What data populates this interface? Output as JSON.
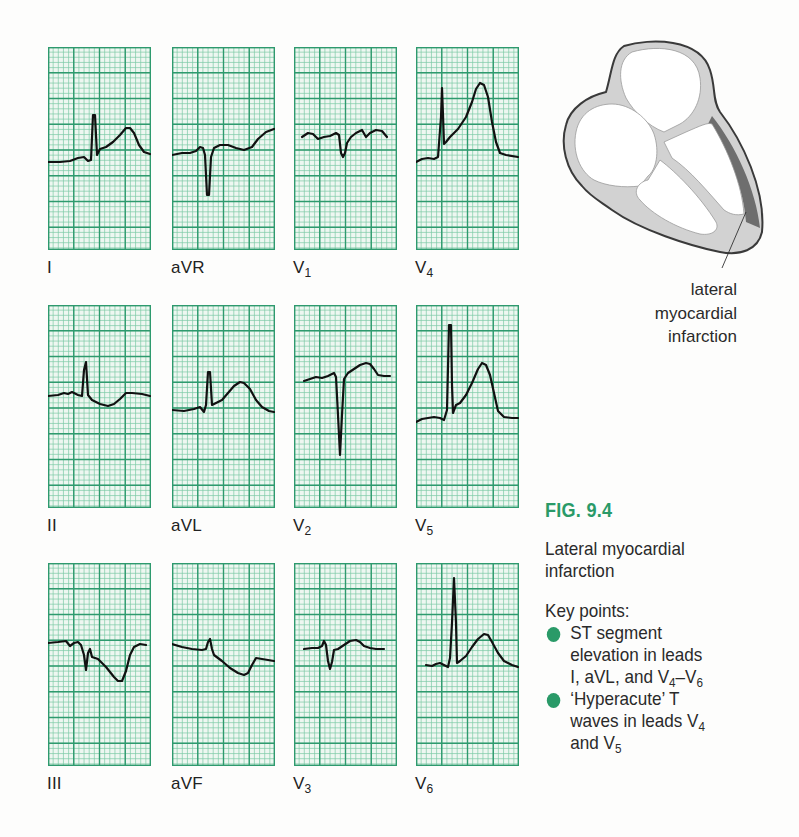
{
  "figure": {
    "number": "FIG. 9.4",
    "title_lines": [
      "Lateral myocardial",
      "infarction"
    ],
    "key_points_heading": "Key points:",
    "key_points": [
      {
        "lines": [
          "ST segment",
          "elevation in leads"
        ],
        "last_line": {
          "text": "I, aVL, and V",
          "sub": "4",
          "text2": "–V",
          "sub2": "6"
        }
      },
      {
        "lines": [
          "‘Hyperacute’ T"
        ],
        "line2": {
          "text": "waves in leads V",
          "sub": "4"
        },
        "line3": {
          "text": "and V",
          "sub": "5"
        }
      }
    ],
    "accent_color": "#2a9a68"
  },
  "diagram": {
    "label_lines": [
      "lateral",
      "myocardial",
      "infarction"
    ],
    "colors": {
      "wall": "#d2d2d2",
      "infarct": "#6e6e6e",
      "outline": "#3a3a3a",
      "chamber": "#ffffff"
    }
  },
  "ecg_grid": {
    "major_color": "#2e9a6e",
    "minor_color": "#7ccaa6",
    "background": "#eef7f1",
    "trace_color": "#111111"
  },
  "chart_data": {
    "type": "line",
    "xlabel": "",
    "ylabel": "",
    "grid": true,
    "panel_size": [
      103,
      203
    ],
    "leads": [
      {
        "name": "I",
        "sub": "",
        "col": 0,
        "row": 0,
        "points": [
          [
            0,
            115
          ],
          [
            12,
            115
          ],
          [
            22,
            114
          ],
          [
            30,
            111
          ],
          [
            36,
            110
          ],
          [
            40,
            114
          ],
          [
            43,
            113
          ],
          [
            45,
            68
          ],
          [
            47,
            68
          ],
          [
            49,
            108
          ],
          [
            52,
            102
          ],
          [
            58,
            100
          ],
          [
            65,
            95
          ],
          [
            72,
            88
          ],
          [
            78,
            81
          ],
          [
            82,
            81
          ],
          [
            86,
            86
          ],
          [
            91,
            98
          ],
          [
            96,
            105
          ],
          [
            102,
            107
          ]
        ]
      },
      {
        "name": "aVR",
        "sub": "",
        "col": 1,
        "row": 0,
        "points": [
          [
            0,
            108
          ],
          [
            10,
            106
          ],
          [
            18,
            106
          ],
          [
            24,
            104
          ],
          [
            28,
            100
          ],
          [
            31,
            101
          ],
          [
            33,
            108
          ],
          [
            35,
            148
          ],
          [
            37,
            148
          ],
          [
            39,
            110
          ],
          [
            42,
            101
          ],
          [
            48,
            98
          ],
          [
            56,
            98
          ],
          [
            64,
            101
          ],
          [
            72,
            103
          ],
          [
            80,
            100
          ],
          [
            86,
            92
          ],
          [
            94,
            85
          ],
          [
            102,
            82
          ]
        ]
      },
      {
        "name": "V",
        "sub": "1",
        "col": 2,
        "row": 0,
        "points": [
          [
            8,
            90
          ],
          [
            14,
            86
          ],
          [
            19,
            87
          ],
          [
            24,
            92
          ],
          [
            30,
            90
          ],
          [
            36,
            89
          ],
          [
            42,
            86
          ],
          [
            45,
            88
          ],
          [
            47,
            106
          ],
          [
            49,
            110
          ],
          [
            51,
            106
          ],
          [
            53,
            96
          ],
          [
            57,
            90
          ],
          [
            62,
            86
          ],
          [
            68,
            83
          ],
          [
            72,
            90
          ],
          [
            76,
            86
          ],
          [
            82,
            83
          ],
          [
            88,
            84
          ],
          [
            93,
            90
          ]
        ]
      },
      {
        "name": "V",
        "sub": "4",
        "col": 3,
        "row": 0,
        "points": [
          [
            0,
            115
          ],
          [
            6,
            112
          ],
          [
            12,
            111
          ],
          [
            18,
            112
          ],
          [
            22,
            110
          ],
          [
            25,
            70
          ],
          [
            26,
            41
          ],
          [
            27,
            68
          ],
          [
            28,
            97
          ],
          [
            30,
            95
          ],
          [
            34,
            90
          ],
          [
            42,
            82
          ],
          [
            50,
            70
          ],
          [
            56,
            55
          ],
          [
            60,
            42
          ],
          [
            64,
            36
          ],
          [
            68,
            38
          ],
          [
            72,
            50
          ],
          [
            76,
            75
          ],
          [
            80,
            95
          ],
          [
            84,
            106
          ],
          [
            90,
            108
          ],
          [
            102,
            110
          ]
        ]
      },
      {
        "name": "II",
        "sub": "",
        "col": 0,
        "row": 1,
        "points": [
          [
            0,
            91
          ],
          [
            10,
            90
          ],
          [
            16,
            88
          ],
          [
            20,
            89
          ],
          [
            24,
            87
          ],
          [
            30,
            90
          ],
          [
            34,
            91
          ],
          [
            36,
            65
          ],
          [
            38,
            57
          ],
          [
            40,
            90
          ],
          [
            44,
            95
          ],
          [
            52,
            99
          ],
          [
            60,
            101
          ],
          [
            66,
            99
          ],
          [
            72,
            94
          ],
          [
            78,
            88
          ],
          [
            84,
            88
          ],
          [
            94,
            89
          ],
          [
            102,
            91
          ]
        ]
      },
      {
        "name": "aVL",
        "sub": "",
        "col": 1,
        "row": 1,
        "points": [
          [
            0,
            105
          ],
          [
            12,
            106
          ],
          [
            22,
            104
          ],
          [
            28,
            102
          ],
          [
            32,
            107
          ],
          [
            34,
            100
          ],
          [
            36,
            67
          ],
          [
            38,
            67
          ],
          [
            40,
            100
          ],
          [
            44,
            98
          ],
          [
            50,
            95
          ],
          [
            56,
            88
          ],
          [
            62,
            81
          ],
          [
            68,
            77
          ],
          [
            72,
            78
          ],
          [
            78,
            84
          ],
          [
            84,
            95
          ],
          [
            90,
            102
          ],
          [
            97,
            106
          ],
          [
            102,
            107
          ]
        ]
      },
      {
        "name": "V",
        "sub": "2",
        "col": 2,
        "row": 1,
        "points": [
          [
            10,
            76
          ],
          [
            16,
            74
          ],
          [
            22,
            72
          ],
          [
            28,
            73
          ],
          [
            34,
            71
          ],
          [
            40,
            68
          ],
          [
            42,
            72
          ],
          [
            44,
            110
          ],
          [
            46,
            150
          ],
          [
            48,
            110
          ],
          [
            50,
            74
          ],
          [
            54,
            68
          ],
          [
            60,
            64
          ],
          [
            66,
            60
          ],
          [
            72,
            58
          ],
          [
            76,
            59
          ],
          [
            80,
            64
          ],
          [
            84,
            70
          ],
          [
            90,
            71
          ],
          [
            96,
            71
          ]
        ]
      },
      {
        "name": "V",
        "sub": "5",
        "col": 3,
        "row": 1,
        "points": [
          [
            0,
            117
          ],
          [
            6,
            114
          ],
          [
            12,
            113
          ],
          [
            18,
            112
          ],
          [
            24,
            113
          ],
          [
            28,
            115
          ],
          [
            31,
            105
          ],
          [
            33,
            20
          ],
          [
            35,
            20
          ],
          [
            36,
            80
          ],
          [
            37,
            108
          ],
          [
            40,
            100
          ],
          [
            44,
            98
          ],
          [
            50,
            90
          ],
          [
            56,
            78
          ],
          [
            62,
            64
          ],
          [
            66,
            58
          ],
          [
            70,
            60
          ],
          [
            74,
            70
          ],
          [
            78,
            88
          ],
          [
            82,
            106
          ],
          [
            88,
            112
          ],
          [
            96,
            113
          ],
          [
            102,
            113
          ]
        ]
      },
      {
        "name": "III",
        "sub": "",
        "col": 0,
        "row": 2,
        "points": [
          [
            0,
            80
          ],
          [
            10,
            79
          ],
          [
            18,
            78
          ],
          [
            22,
            83
          ],
          [
            26,
            80
          ],
          [
            30,
            79
          ],
          [
            33,
            82
          ],
          [
            36,
            92
          ],
          [
            38,
            107
          ],
          [
            40,
            90
          ],
          [
            42,
            86
          ],
          [
            44,
            94
          ],
          [
            50,
            96
          ],
          [
            58,
            104
          ],
          [
            66,
            114
          ],
          [
            70,
            118
          ],
          [
            74,
            118
          ],
          [
            78,
            108
          ],
          [
            82,
            92
          ],
          [
            86,
            84
          ],
          [
            92,
            81
          ],
          [
            98,
            82
          ]
        ]
      },
      {
        "name": "aVF",
        "sub": "",
        "col": 1,
        "row": 2,
        "points": [
          [
            0,
            81
          ],
          [
            10,
            84
          ],
          [
            20,
            86
          ],
          [
            30,
            87
          ],
          [
            34,
            86
          ],
          [
            36,
            79
          ],
          [
            38,
            76
          ],
          [
            40,
            86
          ],
          [
            42,
            92
          ],
          [
            50,
            98
          ],
          [
            58,
            105
          ],
          [
            66,
            110
          ],
          [
            72,
            112
          ],
          [
            76,
            110
          ],
          [
            80,
            102
          ],
          [
            84,
            95
          ],
          [
            90,
            96
          ],
          [
            102,
            98
          ]
        ]
      },
      {
        "name": "V",
        "sub": "3",
        "col": 2,
        "row": 2,
        "points": [
          [
            10,
            86
          ],
          [
            18,
            85
          ],
          [
            24,
            85
          ],
          [
            28,
            83
          ],
          [
            30,
            78
          ],
          [
            32,
            82
          ],
          [
            34,
            98
          ],
          [
            36,
            106
          ],
          [
            38,
            99
          ],
          [
            40,
            87
          ],
          [
            44,
            86
          ],
          [
            50,
            82
          ],
          [
            56,
            78
          ],
          [
            62,
            77
          ],
          [
            66,
            79
          ],
          [
            70,
            83
          ],
          [
            76,
            85
          ],
          [
            82,
            86
          ],
          [
            90,
            86
          ]
        ]
      },
      {
        "name": "V",
        "sub": "6",
        "col": 3,
        "row": 2,
        "points": [
          [
            10,
            102
          ],
          [
            16,
            103
          ],
          [
            20,
            101
          ],
          [
            24,
            100
          ],
          [
            28,
            102
          ],
          [
            32,
            104
          ],
          [
            34,
            95
          ],
          [
            36,
            60
          ],
          [
            38,
            15
          ],
          [
            40,
            60
          ],
          [
            41,
            100
          ],
          [
            44,
            98
          ],
          [
            50,
            93
          ],
          [
            56,
            84
          ],
          [
            62,
            76
          ],
          [
            68,
            71
          ],
          [
            72,
            72
          ],
          [
            76,
            79
          ],
          [
            82,
            90
          ],
          [
            88,
            98
          ],
          [
            96,
            102
          ],
          [
            102,
            104
          ]
        ]
      }
    ]
  }
}
